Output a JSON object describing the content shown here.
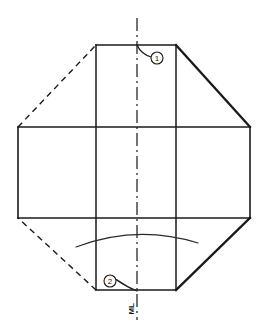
{
  "diagram": {
    "type": "technical-line-drawing",
    "background_color": "#ffffff",
    "line_color": "#1a1a1a",
    "canvas": {
      "width": 267,
      "height": 335
    },
    "outline": {
      "name": "octagon-outline",
      "description": "Regular octagon formed by four straight edges and four corner diagonals",
      "vertices": [
        {
          "x": 96,
          "y": 45,
          "label": "top-left-corner"
        },
        {
          "x": 176,
          "y": 45,
          "label": "top-right-corner"
        },
        {
          "x": 250,
          "y": 127,
          "label": "right-upper-corner"
        },
        {
          "x": 250,
          "y": 218,
          "label": "right-lower-corner"
        },
        {
          "x": 176,
          "y": 290,
          "label": "bottom-right-corner"
        },
        {
          "x": 96,
          "y": 290,
          "label": "bottom-left-corner"
        },
        {
          "x": 18,
          "y": 218,
          "label": "left-lower-corner"
        },
        {
          "x": 18,
          "y": 127,
          "label": "left-upper-corner"
        }
      ],
      "edges": [
        {
          "name": "top-edge",
          "style": "solid",
          "weight": "medium"
        },
        {
          "name": "top-right-diagonal",
          "style": "solid",
          "weight": "bold"
        },
        {
          "name": "right-edge",
          "style": "solid",
          "weight": "medium"
        },
        {
          "name": "bottom-right-diagonal",
          "style": "solid",
          "weight": "bold"
        },
        {
          "name": "bottom-edge",
          "style": "solid",
          "weight": "medium"
        },
        {
          "name": "bottom-left-diagonal",
          "style": "dashed",
          "weight": "medium"
        },
        {
          "name": "left-edge",
          "style": "solid",
          "weight": "medium"
        },
        {
          "name": "top-left-diagonal",
          "style": "dashed",
          "weight": "medium"
        }
      ]
    },
    "grid_lines": [
      {
        "name": "upper-horizontal-fold",
        "orientation": "horizontal",
        "position": 127,
        "from": 18,
        "to": 250,
        "style": "solid"
      },
      {
        "name": "lower-horizontal-fold",
        "orientation": "horizontal",
        "position": 218,
        "from": 18,
        "to": 250,
        "style": "solid"
      },
      {
        "name": "left-vertical-fold",
        "orientation": "vertical",
        "position": 96,
        "from": 45,
        "to": 290,
        "style": "solid"
      },
      {
        "name": "right-vertical-fold",
        "orientation": "vertical",
        "position": 176,
        "from": 45,
        "to": 290,
        "style": "solid"
      }
    ],
    "centre_line": {
      "name": "centre-axis",
      "orientation": "vertical",
      "position": 137,
      "from": 18,
      "to": 320,
      "style": "dash-dot"
    },
    "arc": {
      "name": "lower-curve",
      "style": "solid-thin",
      "start": {
        "x": 76,
        "y": 247
      },
      "control": {
        "x": 137,
        "y": 226
      },
      "end": {
        "x": 198,
        "y": 243
      }
    },
    "callouts": [
      {
        "id": "callout-1",
        "label": "1",
        "circle": {
          "cx": 157,
          "cy": 58,
          "r": 6
        },
        "leader_from": {
          "x": 137,
          "y": 45
        },
        "leader_to": {
          "x": 151,
          "y": 56
        }
      },
      {
        "id": "callout-2",
        "label": "2",
        "circle": {
          "cx": 110,
          "cy": 281,
          "r": 6
        },
        "leader_from": {
          "x": 137,
          "y": 291
        },
        "leader_to": {
          "x": 116,
          "y": 279
        }
      }
    ],
    "annotations": [
      {
        "name": "ml-marking",
        "text": "ML",
        "x": 131,
        "y": 309,
        "rotation": -90
      }
    ]
  }
}
